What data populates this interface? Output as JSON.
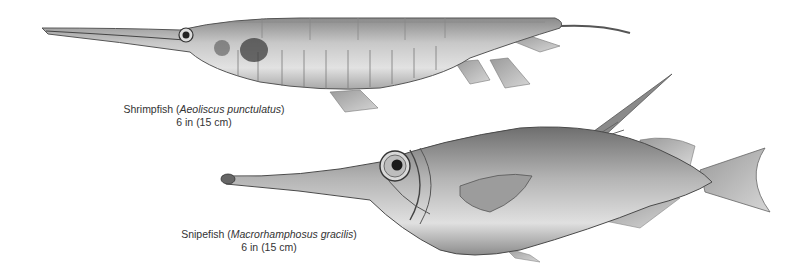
{
  "illustration": {
    "background": "#ffffff",
    "style": "grayscale scientific illustration",
    "fish": [
      {
        "common_name": "Shrimpfish",
        "scientific_name": "Aeoliscus punctulatus",
        "size": "6 in (15 cm)",
        "caption_prefix": "Shrimpfish (",
        "caption_suffix": ")"
      },
      {
        "common_name": "Snipefish",
        "scientific_name": "Macrorhamphosus gracilis",
        "size": "6 in (15 cm)",
        "caption_prefix": "Snipefish (",
        "caption_suffix": ")"
      }
    ]
  }
}
